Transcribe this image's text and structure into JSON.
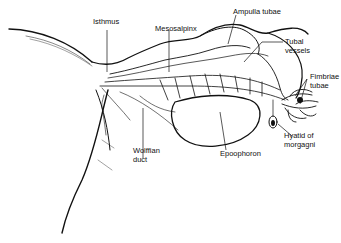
{
  "figure": {
    "type": "anatomical line drawing",
    "colors": {
      "ink": "#111111",
      "background": "#ffffff"
    }
  },
  "labels": {
    "isthmus": "Isthmus",
    "mesosalpinx": "Mesosalpinx",
    "ampulla": "Ampulla tubae",
    "tubal_vessels": "Tubal\nvessels",
    "fimbriae": "Fimbriae\ntubae",
    "hyatid": "Hyatid of\nmorgagni",
    "epoophoron": "Epoophoron",
    "wolffian": "Wolffian\nduct"
  }
}
